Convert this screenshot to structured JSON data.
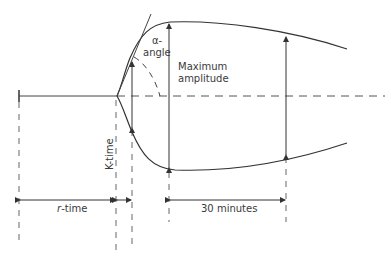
{
  "diagram": {
    "type": "thromboelastography tracing",
    "labels": {
      "alpha_line1": "α-",
      "alpha_line2": "angle",
      "max_amp_line1": "Maximum",
      "max_amp_line2": "amplitude",
      "r_time_italic": "r",
      "r_time_rest": "-time",
      "k_time": "K-time",
      "thirty_min": "30 minutes"
    },
    "colors": {
      "line": "#333333",
      "dashed": "#555555",
      "text": "#3a3a3a"
    }
  }
}
